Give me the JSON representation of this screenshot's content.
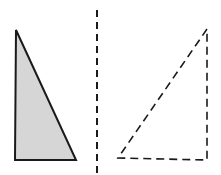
{
  "diagram": {
    "colors": {
      "background": "#ffffff",
      "stroke": "#1a1a1a",
      "fill": "#d6d6d6"
    },
    "original_triangle": {
      "points": "16,30 15,160 76,160",
      "style": "solid-shaded"
    },
    "mirror_line": {
      "x": 97,
      "y1": 10,
      "y2": 175,
      "style": "dashed"
    },
    "reflected_triangle": {
      "points": "207,29 118,158 207,160",
      "style": "dashed-unfilled"
    }
  }
}
